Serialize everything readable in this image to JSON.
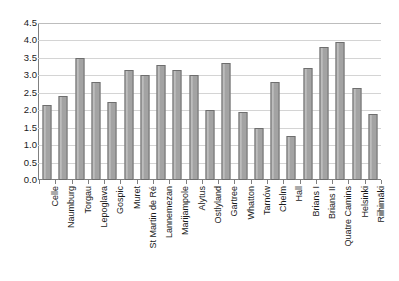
{
  "chart_data": {
    "type": "bar",
    "title": "",
    "subtitle": "",
    "xlabel": "",
    "ylabel": "",
    "ylim": [
      0.0,
      4.5
    ],
    "yticks": [
      "0.0",
      "0.5",
      "1.0",
      "1.5",
      "2.0",
      "2.5",
      "3.0",
      "3.5",
      "4.0",
      "4.5"
    ],
    "ytick_values": [
      0.0,
      0.5,
      1.0,
      1.5,
      2.0,
      2.5,
      3.0,
      3.5,
      4.0,
      4.5
    ],
    "grid": true,
    "grid_axis": "y",
    "legend": false,
    "legend_position": "none",
    "bar_color": "#a9a9a9",
    "bar_edge_color": "#6e6e6e",
    "categories": [
      "Celle",
      "Naumburg",
      "Torgau",
      "Lepoglava",
      "Gospic",
      "Muret",
      "St Martin de Ré",
      "Lannemezan",
      "Marijampole",
      "Alytus",
      "Ostlyland",
      "Gartree",
      "Whatton",
      "Tarnów",
      "Chelm",
      "Hall",
      "Brians I",
      "Brians II",
      "Quatre Camins",
      "Helsinki",
      "Riihimäki"
    ],
    "values": [
      2.15,
      2.4,
      3.5,
      2.8,
      2.25,
      3.15,
      3.0,
      3.3,
      3.15,
      3.0,
      2.0,
      3.35,
      1.95,
      1.5,
      2.8,
      1.25,
      3.2,
      3.8,
      3.95,
      2.65,
      1.9
    ]
  }
}
